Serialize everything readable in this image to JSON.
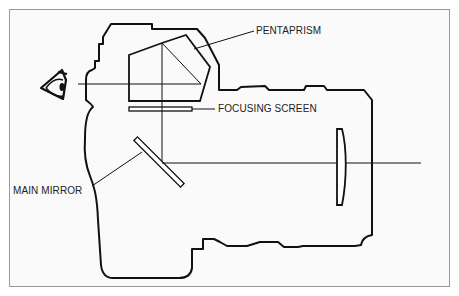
{
  "diagram": {
    "type": "SLR camera cross-section",
    "labels": {
      "pentaprism": "PENTAPRISM",
      "focusing_screen": "FOCUSING SCREEN",
      "main_mirror": "MAIN MIRROR"
    },
    "icons": {
      "eye": "eye-icon"
    },
    "colors": {
      "line": "#111111",
      "background": "#fafafa",
      "border": "#9a9a9a"
    }
  }
}
